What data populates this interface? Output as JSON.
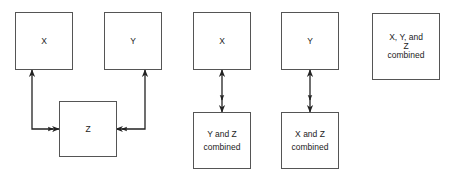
{
  "diagram": {
    "panels": [
      {
        "id": "separate",
        "boxes": [
          {
            "id": "x",
            "label": "X"
          },
          {
            "id": "y",
            "label": "Y"
          },
          {
            "id": "z",
            "label": "Z"
          }
        ],
        "links": [
          {
            "from": "x",
            "to": "z",
            "type": "bidirectional"
          },
          {
            "from": "y",
            "to": "z",
            "type": "bidirectional"
          }
        ]
      },
      {
        "id": "x-and-yz",
        "boxes": [
          {
            "id": "x",
            "label": "X"
          },
          {
            "id": "yz",
            "label": "Y and Z combined"
          }
        ],
        "links": [
          {
            "from": "x",
            "to": "yz",
            "type": "bidirectional"
          }
        ]
      },
      {
        "id": "y-and-xz",
        "boxes": [
          {
            "id": "y",
            "label": "Y"
          },
          {
            "id": "xz",
            "label": "X and Z combined"
          }
        ],
        "links": [
          {
            "from": "y",
            "to": "xz",
            "type": "bidirectional"
          }
        ]
      },
      {
        "id": "xyz",
        "boxes": [
          {
            "id": "xyz",
            "label": "X, Y, and Z combined"
          }
        ],
        "links": []
      }
    ]
  },
  "labels": {
    "p1_x": "X",
    "p1_y": "Y",
    "p1_z": "Z",
    "p2_x": "X",
    "p2_yz_line1": "Y and Z",
    "p2_yz_line2": "combined",
    "p3_y": "Y",
    "p3_xz_line1": "X and Z",
    "p3_xz_line2": "combined",
    "p4_line1": "X, Y, and",
    "p4_line2": "Z",
    "p4_line3": "combined"
  }
}
